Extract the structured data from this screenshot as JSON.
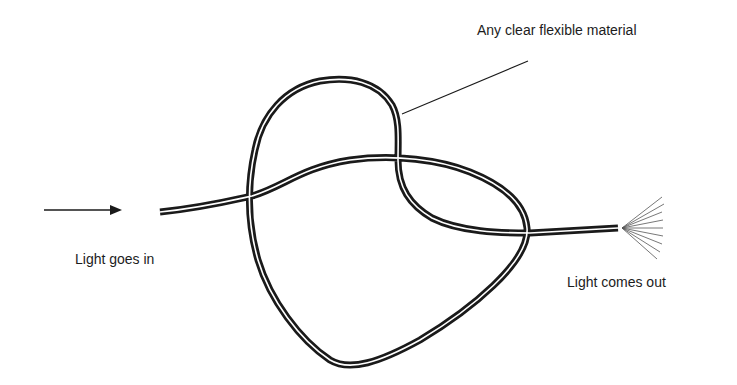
{
  "diagram": {
    "type": "fiber-optic-illustration",
    "labels": {
      "material": "Any clear flexible material",
      "input": "Light goes in",
      "output": "Light comes out"
    },
    "elements": {
      "input_arrow": "arrow-right-icon",
      "tube": "knotted-tube",
      "output_rays": "light-rays-icon",
      "leader_line": "callout-line"
    },
    "colors": {
      "stroke": "#1a1a1a",
      "tube_core": "#ffffff",
      "background": "#ffffff",
      "text": "#1c1c1c"
    }
  }
}
